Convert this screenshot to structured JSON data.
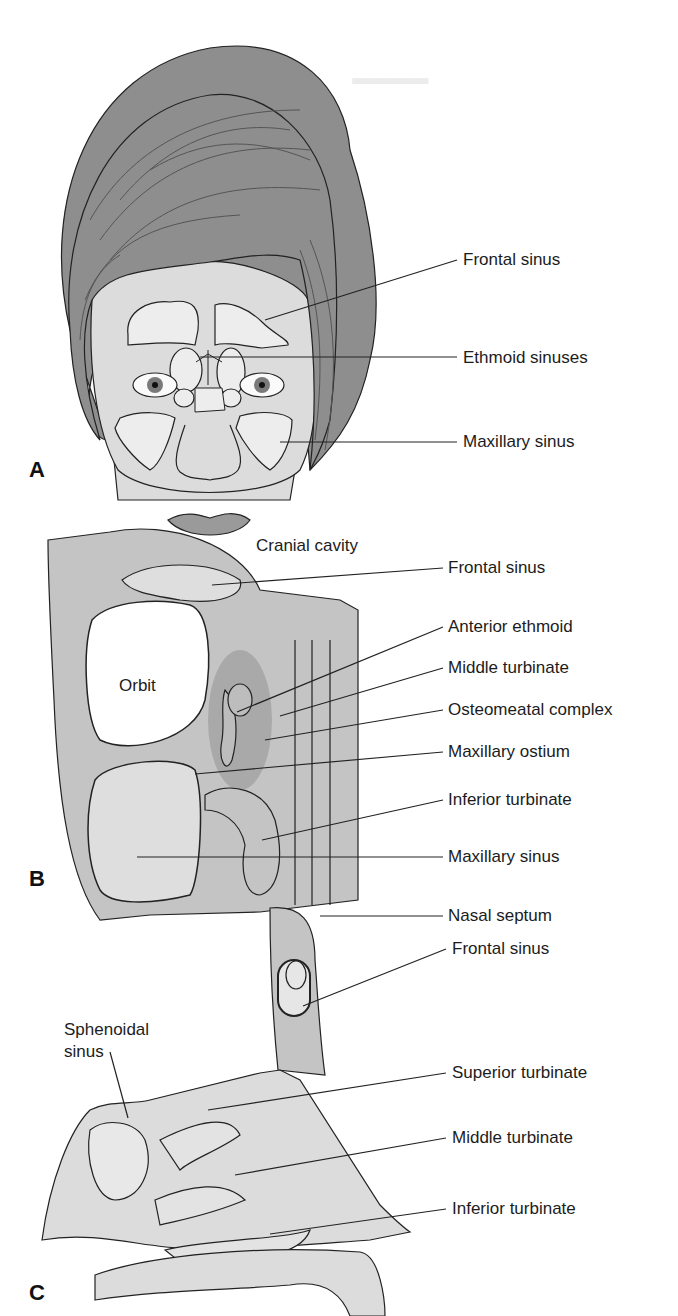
{
  "figure": {
    "panels": [
      {
        "letter": "A",
        "view": "frontal-face",
        "labels": [
          {
            "text": "Frontal sinus",
            "x": 463,
            "y": 250
          },
          {
            "text": "Ethmoid sinuses",
            "x": 463,
            "y": 348
          },
          {
            "text": "Maxillary sinus",
            "x": 463,
            "y": 434
          }
        ]
      },
      {
        "letter": "B",
        "view": "coronal-section",
        "labels": [
          {
            "text": "Cranial cavity",
            "x": 256,
            "y": 536
          },
          {
            "text": "Frontal sinus",
            "x": 448,
            "y": 558
          },
          {
            "text": "Anterior ethmoid",
            "x": 448,
            "y": 616
          },
          {
            "text": "Middle turbinate",
            "x": 448,
            "y": 657
          },
          {
            "text": "Osteomeatal complex",
            "x": 448,
            "y": 699
          },
          {
            "text": "Maxillary ostium",
            "x": 448,
            "y": 741
          },
          {
            "text": "Inferior turbinate",
            "x": 448,
            "y": 788
          },
          {
            "text": "Maxillary sinus",
            "x": 448,
            "y": 846
          },
          {
            "text": "Nasal septum",
            "x": 448,
            "y": 905
          },
          {
            "text": "Orbit",
            "x": 119,
            "y": 676
          }
        ]
      },
      {
        "letter": "C",
        "view": "sagittal-section",
        "labels": [
          {
            "text": "Frontal sinus",
            "x": 452,
            "y": 939
          },
          {
            "text": "Sphenoidal",
            "x": 64,
            "y": 1020
          },
          {
            "text": "sinus",
            "x": 64,
            "y": 1044
          },
          {
            "text": "Superior turbinate",
            "x": 452,
            "y": 1063
          },
          {
            "text": "Middle turbinate",
            "x": 452,
            "y": 1127
          },
          {
            "text": "Inferior turbinate",
            "x": 452,
            "y": 1198
          }
        ]
      }
    ],
    "panel_letters": [
      {
        "text": "A",
        "x": 29,
        "y": 457
      },
      {
        "text": "B",
        "x": 29,
        "y": 867
      },
      {
        "text": "C",
        "x": 29,
        "y": 1280
      }
    ],
    "colors": {
      "hair": "#8e8e8e",
      "skin": "#dcdcdc",
      "sinus": "#ededed",
      "bone": "#c4c4c4",
      "dark_region": "#a9a9a9",
      "line": "#222222"
    }
  }
}
